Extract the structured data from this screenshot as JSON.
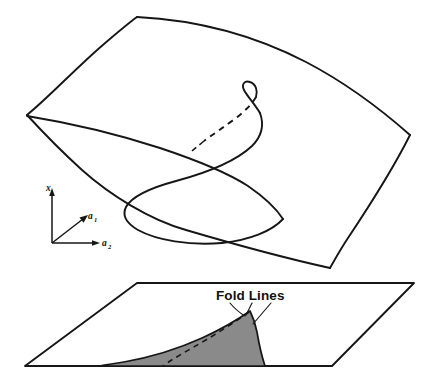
{
  "figure": {
    "type": "diagram",
    "background_color": "#ffffff",
    "line_color": "#161616",
    "shaded_region_color": "#8a8a8a",
    "annotations": {
      "fold_lines_label": "Fold Lines"
    },
    "axes": {
      "vertical": {
        "label": "x",
        "subscript": ""
      },
      "depth": {
        "label": "a",
        "subscript": "1"
      },
      "horizontal": {
        "label": "a",
        "subscript": "2"
      }
    },
    "parts": [
      {
        "name": "equilibrium-surface",
        "label": "Equilibrium surface (pleated sheet)"
      },
      {
        "name": "fold-curve",
        "label": "Fold curve on surface"
      },
      {
        "name": "control-plane",
        "label": "Control parameter plane"
      },
      {
        "name": "bifurcation-set",
        "label": "Shaded cusp region (bifurcation set)"
      }
    ]
  },
  "geometry": {
    "upper_surface_outline": "M 137,17 C 205,20 290,48 410,135 L 330,268 C 270,250 190,222 125,215 L 27,115 C 60,100 100,60 137,17 Z",
    "control_plane_outline": "M 137,283 L 414,283 L 332,366 L 25,366 Z",
    "cusp_apex": {
      "x": 250,
      "y": 311
    },
    "surface_cusp_point": {
      "x": 251,
      "y": 93
    }
  }
}
